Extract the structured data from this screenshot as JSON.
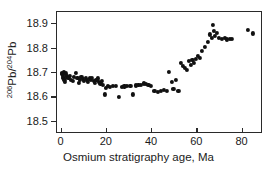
{
  "chart_data": {
    "type": "scatter",
    "title": "",
    "xlabel": "Osmium stratigraphy age, Ma",
    "ylabel": "206Pb/204Pb",
    "ylabel_numerator_sup": "206",
    "ylabel_numerator_base": "Pb/",
    "ylabel_denominator_sup": "204",
    "ylabel_denominator_base": "Pb",
    "xlim": [
      -2,
      89
    ],
    "ylim": [
      18.45,
      18.95
    ],
    "xticks": [
      0,
      20,
      40,
      60,
      80
    ],
    "xticklabels": [
      "0",
      "20",
      "40",
      "60",
      "80"
    ],
    "yticks": [
      18.5,
      18.6,
      18.7,
      18.8,
      18.9
    ],
    "yticklabels": [
      "18.5",
      "18.6",
      "18.7",
      "18.8",
      "18.9"
    ],
    "grid": false,
    "legend": null,
    "marker_color": "#111111",
    "frame_color": "#2a2a2a",
    "background": "#ffffff",
    "series": [
      {
        "name": "Pb isotope ratio vs age",
        "x": [
          0.3,
          0.4,
          0.5,
          0.8,
          1.0,
          1.3,
          1.6,
          2.0,
          2.4,
          3.0,
          3.6,
          4.2,
          5.0,
          5.6,
          6.3,
          7.0,
          7.6,
          8.2,
          8.8,
          9.4,
          10.0,
          10.6,
          11.2,
          11.8,
          12.4,
          13.0,
          13.6,
          14.2,
          14.8,
          15.4,
          16.0,
          16.6,
          17.2,
          17.8,
          18.4,
          19.0,
          19.6,
          20.4,
          21.4,
          22.6,
          24.0,
          25.4,
          26.6,
          27.8,
          29.0,
          30.4,
          31.6,
          32.8,
          34.0,
          35.2,
          36.4,
          37.4,
          38.4,
          39.4,
          41.0,
          42.6,
          44.0,
          45.2,
          46.4,
          47.6,
          48.6,
          49.4,
          50.4,
          51.6,
          52.6,
          53.6,
          54.6,
          55.4,
          56.2,
          57.0,
          57.8,
          58.6,
          59.4,
          60.2,
          61.0,
          62.0,
          63.4,
          64.6,
          65.6,
          66.4,
          67.0,
          67.4,
          67.8,
          68.6,
          69.6,
          70.8,
          72.0,
          73.2,
          74.4,
          75.4,
          82.2,
          84.4
        ],
        "y": [
          18.7,
          18.695,
          18.69,
          18.68,
          18.703,
          18.673,
          18.663,
          18.698,
          18.686,
          18.68,
          18.688,
          18.673,
          18.668,
          18.683,
          18.699,
          18.679,
          18.658,
          18.672,
          18.684,
          18.676,
          18.669,
          18.681,
          18.673,
          18.663,
          18.678,
          18.671,
          18.681,
          18.666,
          18.659,
          18.672,
          18.678,
          18.665,
          18.657,
          18.668,
          18.651,
          18.612,
          18.64,
          18.648,
          18.642,
          18.646,
          18.648,
          18.601,
          18.644,
          18.645,
          18.648,
          18.647,
          18.612,
          18.649,
          18.652,
          18.65,
          18.657,
          18.655,
          18.65,
          18.648,
          18.627,
          18.622,
          18.625,
          18.632,
          18.628,
          18.706,
          18.663,
          18.634,
          18.673,
          18.628,
          18.741,
          18.728,
          18.722,
          18.712,
          18.75,
          18.733,
          18.755,
          18.742,
          18.758,
          18.77,
          18.762,
          18.79,
          18.808,
          18.828,
          18.858,
          18.845,
          18.898,
          18.872,
          18.853,
          18.866,
          18.845,
          18.84,
          18.843,
          18.838,
          18.84,
          18.841,
          18.876,
          18.862
        ]
      }
    ]
  }
}
